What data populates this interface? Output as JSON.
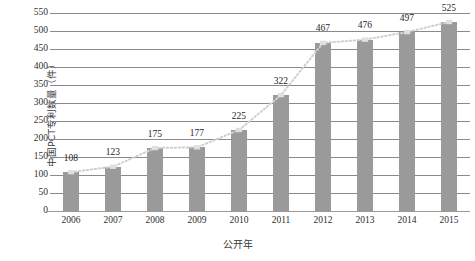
{
  "chart_data": {
    "type": "bar",
    "title": "",
    "xlabel": "公开年",
    "ylabel": "中国PCT专利数量（件）",
    "categories": [
      "2006",
      "2007",
      "2008",
      "2009",
      "2010",
      "2011",
      "2012",
      "2013",
      "2014",
      "2015"
    ],
    "values": [
      108,
      123,
      175,
      177,
      225,
      322,
      467,
      476,
      497,
      525
    ],
    "value_labels": [
      "108",
      "123",
      "175",
      "177",
      "225",
      "322",
      "467",
      "476",
      "497",
      "525"
    ],
    "ylim": [
      0,
      550
    ],
    "ytick_step": 50,
    "ytick_labels": [
      "0",
      "50",
      "100",
      "150",
      "200",
      "250",
      "300",
      "350",
      "400",
      "450",
      "500",
      "550"
    ],
    "grid": true,
    "legend": "none",
    "series": [
      {
        "name": "中国PCT专利数量",
        "type": "bar",
        "values": [
          108,
          123,
          175,
          177,
          225,
          322,
          467,
          476,
          497,
          525
        ]
      },
      {
        "name": "趋势线",
        "type": "line",
        "style": "dotted",
        "values": [
          108,
          123,
          175,
          177,
          225,
          322,
          467,
          476,
          497,
          525
        ]
      }
    ],
    "colors": {
      "bar": "#9a9a9a",
      "gridline": "#8a8a8a",
      "trendline": "#cfcfcf",
      "marker": "#e0e0e0",
      "text": "#2f2f2f",
      "background": "#ffffff"
    }
  }
}
